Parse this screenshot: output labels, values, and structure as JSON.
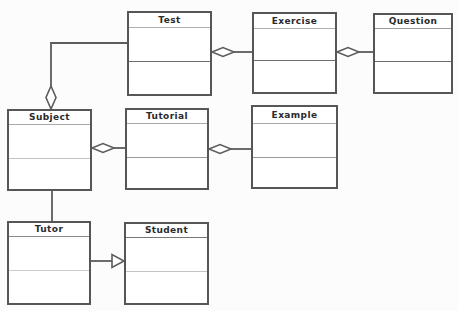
{
  "diagram": {
    "type": "uml-class-diagram",
    "classes": [
      {
        "name": "Test"
      },
      {
        "name": "Exercise"
      },
      {
        "name": "Question"
      },
      {
        "name": "Subject"
      },
      {
        "name": "Tutorial"
      },
      {
        "name": "Example"
      },
      {
        "name": "Tutor"
      },
      {
        "name": "Student"
      }
    ],
    "relationships": [
      {
        "type": "aggregation",
        "whole": "Subject",
        "part": "Test"
      },
      {
        "type": "aggregation",
        "whole": "Test",
        "part": "Exercise"
      },
      {
        "type": "aggregation",
        "whole": "Exercise",
        "part": "Question"
      },
      {
        "type": "aggregation",
        "whole": "Subject",
        "part": "Tutorial"
      },
      {
        "type": "aggregation",
        "whole": "Tutorial",
        "part": "Example"
      },
      {
        "type": "association",
        "from": "Subject",
        "to": "Tutor"
      },
      {
        "type": "generalization",
        "from": "Tutor",
        "to": "Student"
      }
    ],
    "colors": {
      "line": "#5c5c5c",
      "box_border": "#565656",
      "box_fill": "#ffffff",
      "text": "#2b2b2b",
      "background": "#fcfcfc"
    }
  }
}
